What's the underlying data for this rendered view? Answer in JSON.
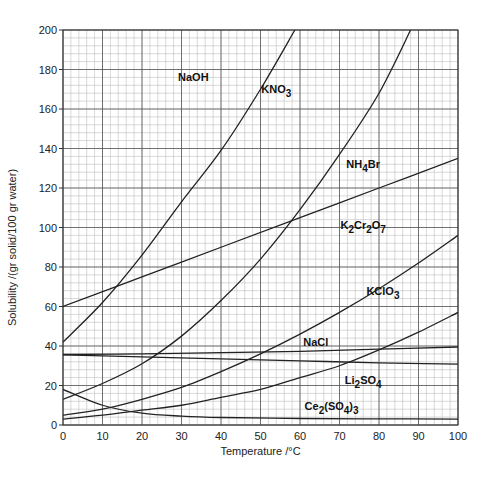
{
  "chart_data": {
    "type": "line",
    "title": "",
    "xlabel": "Temperature /°C",
    "ylabel": "Solubility /(gr solid/100 gr water)",
    "xlim": [
      0,
      100
    ],
    "ylim": [
      0,
      200
    ],
    "x_ticks": [
      0,
      10,
      20,
      30,
      40,
      50,
      60,
      70,
      80,
      90,
      100
    ],
    "y_ticks": [
      0,
      20,
      40,
      60,
      80,
      100,
      120,
      140,
      160,
      180,
      200
    ],
    "x_minor_step": 2,
    "y_minor_step": 4,
    "grid": true,
    "legend": "none (labels placed next to curves)",
    "series": [
      {
        "name": "NaOH",
        "label_parts": [
          [
            "NaOH",
            ""
          ]
        ],
        "points": [
          [
            0,
            42
          ],
          [
            10,
            62
          ],
          [
            20,
            86
          ],
          [
            30,
            113
          ],
          [
            40,
            139
          ],
          [
            50,
            170
          ],
          [
            58.7,
            200
          ]
        ]
      },
      {
        "name": "KNO3",
        "label_parts": [
          [
            "KNO",
            ""
          ],
          [
            "3",
            "sub"
          ]
        ],
        "points": [
          [
            0,
            13
          ],
          [
            10,
            21
          ],
          [
            20,
            31
          ],
          [
            30,
            45
          ],
          [
            40,
            63
          ],
          [
            50,
            84
          ],
          [
            60,
            109
          ],
          [
            70,
            137
          ],
          [
            80,
            168
          ],
          [
            88,
            200
          ]
        ]
      },
      {
        "name": "NH4Br",
        "label_parts": [
          [
            "NH",
            ""
          ],
          [
            "4",
            "sub"
          ],
          [
            "Br",
            ""
          ]
        ],
        "points": [
          [
            0,
            60
          ],
          [
            20,
            75
          ],
          [
            40,
            90
          ],
          [
            60,
            105
          ],
          [
            80,
            120
          ],
          [
            100,
            135
          ]
        ]
      },
      {
        "name": "K2Cr2O7",
        "label_parts": [
          [
            "K",
            ""
          ],
          [
            "2",
            "sub"
          ],
          [
            "Cr",
            ""
          ],
          [
            "2",
            "sub"
          ],
          [
            "O",
            ""
          ],
          [
            "7",
            "sub"
          ]
        ],
        "points": [
          [
            0,
            5
          ],
          [
            10,
            8
          ],
          [
            20,
            13
          ],
          [
            30,
            19
          ],
          [
            40,
            27
          ],
          [
            50,
            36
          ],
          [
            60,
            46
          ],
          [
            70,
            57
          ],
          [
            80,
            69
          ],
          [
            90,
            82
          ],
          [
            100,
            96
          ]
        ]
      },
      {
        "name": "KClO3",
        "label_parts": [
          [
            "KClO",
            ""
          ],
          [
            "3",
            "sub"
          ]
        ],
        "points": [
          [
            0,
            3
          ],
          [
            10,
            5
          ],
          [
            20,
            7.5
          ],
          [
            30,
            10
          ],
          [
            40,
            14
          ],
          [
            50,
            18
          ],
          [
            60,
            24
          ],
          [
            70,
            30
          ],
          [
            80,
            38
          ],
          [
            90,
            47
          ],
          [
            100,
            57
          ]
        ]
      },
      {
        "name": "NaCl",
        "label_parts": [
          [
            "NaCl",
            ""
          ]
        ],
        "points": [
          [
            0,
            35.7
          ],
          [
            20,
            36
          ],
          [
            40,
            36.6
          ],
          [
            60,
            37.3
          ],
          [
            80,
            38.4
          ],
          [
            100,
            39.5
          ]
        ]
      },
      {
        "name": "Li2SO4",
        "label_parts": [
          [
            "Li",
            ""
          ],
          [
            "2",
            "sub"
          ],
          [
            "SO",
            ""
          ],
          [
            "4",
            "sub"
          ]
        ],
        "points": [
          [
            0,
            35.5
          ],
          [
            20,
            34.5
          ],
          [
            40,
            33.5
          ],
          [
            60,
            32.5
          ],
          [
            80,
            31.5
          ],
          [
            100,
            30.8
          ]
        ]
      },
      {
        "name": "Ce2(SO4)3",
        "label_parts": [
          [
            "Ce",
            ""
          ],
          [
            "2",
            "sub"
          ],
          [
            "(SO",
            ""
          ],
          [
            "4",
            "sub"
          ],
          [
            ")",
            ""
          ],
          [
            "3",
            "sub"
          ]
        ],
        "points": [
          [
            0,
            18
          ],
          [
            10,
            10
          ],
          [
            20,
            6
          ],
          [
            30,
            4.5
          ],
          [
            40,
            3.8
          ],
          [
            60,
            3.3
          ],
          [
            80,
            3.1
          ],
          [
            100,
            3
          ]
        ]
      }
    ],
    "label_anchor_points": {
      "NaOH": [
        33,
        174
      ],
      "KNO3": [
        54,
        168
      ],
      "NH4Br": [
        76,
        130
      ],
      "K2Cr2O7": [
        76,
        99
      ],
      "KClO3": [
        81,
        66
      ],
      "NaCl": [
        64,
        40
      ],
      "Li2SO4": [
        76,
        21
      ],
      "Ce2(SO4)3": [
        68,
        7.5
      ]
    }
  }
}
